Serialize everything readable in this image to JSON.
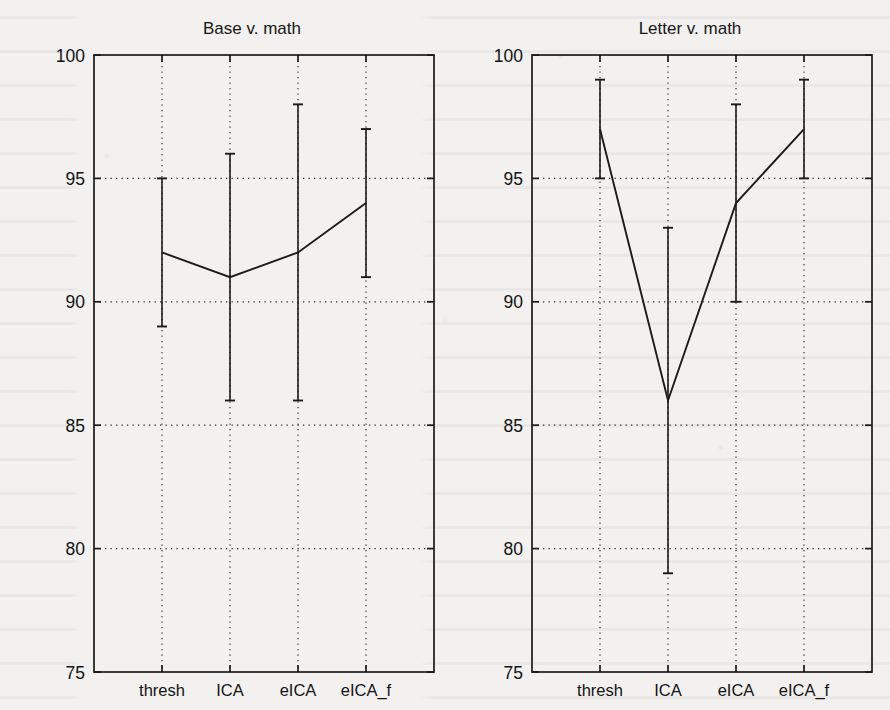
{
  "figure": {
    "ylabel": "Classificatiion accuracy, %",
    "background_color": "#f2f1ef",
    "ink_color": "#1b1b1b"
  },
  "chart_data": [
    {
      "type": "line",
      "title": "Base v. math",
      "panel": "left",
      "xlabel": "",
      "ylabel": "Classificatiion accuracy, %",
      "categories": [
        "thresh",
        "ICA",
        "eICA",
        "eICA_f"
      ],
      "values": [
        92,
        91,
        92,
        94
      ],
      "error_low": [
        89,
        86,
        86,
        91
      ],
      "error_high": [
        95,
        96,
        98,
        97
      ],
      "ylim": [
        75,
        100
      ],
      "yticks": [
        75,
        80,
        85,
        90,
        95,
        100
      ],
      "ytick_labels": [
        "75",
        "80",
        "85",
        "90",
        "95",
        "100"
      ],
      "grid": true,
      "grid_style": "dotted",
      "legend": "none"
    },
    {
      "type": "line",
      "title": "Letter v. math",
      "panel": "right",
      "xlabel": "",
      "ylabel": "",
      "categories": [
        "thresh",
        "ICA",
        "eICA",
        "eICA_f"
      ],
      "values": [
        97,
        86,
        94,
        97
      ],
      "error_low": [
        95,
        79,
        90,
        95
      ],
      "error_high": [
        99,
        93,
        98,
        99
      ],
      "ylim": [
        75,
        100
      ],
      "yticks": [
        75,
        80,
        85,
        90,
        95,
        100
      ],
      "ytick_labels": [
        "75",
        "80",
        "85",
        "90",
        "95",
        "100"
      ],
      "grid": true,
      "grid_style": "dotted",
      "legend": "none"
    }
  ]
}
